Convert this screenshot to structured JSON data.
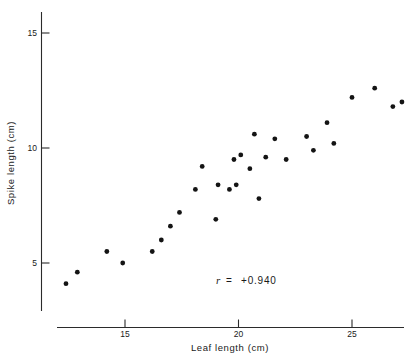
{
  "chart_data": {
    "type": "scatter",
    "title": "",
    "xlabel": "Leaf length (cm)",
    "ylabel": "Spike length (cm)",
    "xlim": [
      12.0,
      27.6
    ],
    "ylim": [
      3.3,
      15.6
    ],
    "xticks": [
      15,
      20,
      25
    ],
    "xtick_labels": [
      "15",
      "20",
      "25"
    ],
    "yticks": [
      5,
      10,
      15
    ],
    "ytick_labels": [
      "5",
      "10",
      "15"
    ],
    "grid": false,
    "legend": "none",
    "annotations": [
      {
        "name": "correlation-coefficient",
        "symbol": "r",
        "equals": "=",
        "value": "+0.940",
        "text": "r  =  +0.940",
        "x": 19.4,
        "y": 4.3
      }
    ],
    "points": [
      {
        "x": 12.4,
        "y": 4.1
      },
      {
        "x": 12.9,
        "y": 4.6
      },
      {
        "x": 14.2,
        "y": 5.5
      },
      {
        "x": 14.9,
        "y": 5.0
      },
      {
        "x": 16.2,
        "y": 5.5
      },
      {
        "x": 16.6,
        "y": 6.0
      },
      {
        "x": 17.0,
        "y": 6.6
      },
      {
        "x": 17.4,
        "y": 7.2
      },
      {
        "x": 18.1,
        "y": 8.2
      },
      {
        "x": 18.4,
        "y": 9.2
      },
      {
        "x": 19.0,
        "y": 6.9
      },
      {
        "x": 19.1,
        "y": 8.4
      },
      {
        "x": 19.6,
        "y": 8.2
      },
      {
        "x": 19.8,
        "y": 9.5
      },
      {
        "x": 19.9,
        "y": 8.4
      },
      {
        "x": 20.1,
        "y": 9.7
      },
      {
        "x": 20.5,
        "y": 9.1
      },
      {
        "x": 20.7,
        "y": 10.6
      },
      {
        "x": 20.9,
        "y": 7.8
      },
      {
        "x": 21.2,
        "y": 9.6
      },
      {
        "x": 21.6,
        "y": 10.4
      },
      {
        "x": 22.1,
        "y": 9.5
      },
      {
        "x": 23.0,
        "y": 10.5
      },
      {
        "x": 23.3,
        "y": 9.9
      },
      {
        "x": 23.9,
        "y": 11.1
      },
      {
        "x": 24.2,
        "y": 10.2
      },
      {
        "x": 25.0,
        "y": 12.2
      },
      {
        "x": 26.0,
        "y": 12.6
      },
      {
        "x": 26.8,
        "y": 11.8
      },
      {
        "x": 27.2,
        "y": 12.0
      }
    ]
  },
  "axes": {
    "x_axis_name": "x-axis",
    "y_axis_name": "y-axis"
  }
}
